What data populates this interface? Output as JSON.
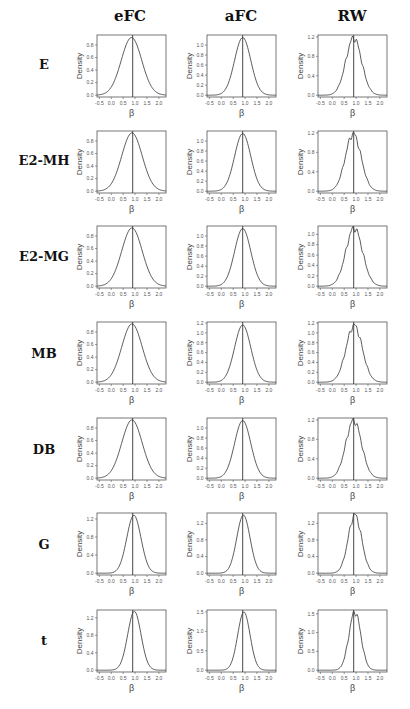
{
  "chart_data": {
    "type": "line",
    "layout": "grid 7 rows x 3 columns of density plots",
    "columns": [
      "eFC",
      "aFC",
      "RW"
    ],
    "rows": [
      "E",
      "E2-MH",
      "E2-MG",
      "MB",
      "DB",
      "G",
      "t"
    ],
    "xlabel": "β",
    "ylabel": "Density",
    "xlim": [
      -0.6,
      2.3
    ],
    "xticks": [
      -0.5,
      0.0,
      0.5,
      1.0,
      1.5,
      2.0
    ],
    "xtick_labels": [
      "-0.5",
      "0.0",
      "0.5",
      "1.0",
      "1.5",
      "2.0"
    ],
    "vertical_line_x": 0.9,
    "panels": [
      {
        "row": "E",
        "col": "eFC",
        "mean": 0.85,
        "sd": 0.43,
        "peak": 0.92,
        "ymax": 0.96,
        "yticks": [
          0.0,
          0.2,
          0.4,
          0.6,
          0.8
        ],
        "rough": false
      },
      {
        "row": "E",
        "col": "aFC",
        "mean": 0.9,
        "sd": 0.34,
        "peak": 1.15,
        "ymax": 1.2,
        "yticks": [
          0.0,
          0.2,
          0.4,
          0.6,
          0.8,
          1.0
        ],
        "rough": false
      },
      {
        "row": "E",
        "col": "RW",
        "mean": 0.9,
        "sd": 0.33,
        "peak": 1.18,
        "ymax": 1.24,
        "yticks": [
          0.0,
          0.4,
          0.8,
          1.2
        ],
        "rough": true
      },
      {
        "row": "E2-MH",
        "col": "eFC",
        "mean": 0.87,
        "sd": 0.43,
        "peak": 0.93,
        "ymax": 0.96,
        "yticks": [
          0.0,
          0.2,
          0.4,
          0.6,
          0.8
        ],
        "rough": false
      },
      {
        "row": "E2-MH",
        "col": "aFC",
        "mean": 0.9,
        "sd": 0.34,
        "peak": 1.15,
        "ymax": 1.2,
        "yticks": [
          0.0,
          0.2,
          0.4,
          0.6,
          0.8,
          1.0
        ],
        "rough": false
      },
      {
        "row": "E2-MH",
        "col": "RW",
        "mean": 0.88,
        "sd": 0.33,
        "peak": 1.18,
        "ymax": 1.24,
        "yticks": [
          0.0,
          0.4,
          0.8,
          1.2
        ],
        "rough": true
      },
      {
        "row": "E2-MG",
        "col": "eFC",
        "mean": 0.87,
        "sd": 0.43,
        "peak": 0.93,
        "ymax": 0.96,
        "yticks": [
          0.0,
          0.2,
          0.4,
          0.6,
          0.8
        ],
        "rough": false
      },
      {
        "row": "E2-MG",
        "col": "aFC",
        "mean": 0.9,
        "sd": 0.34,
        "peak": 1.15,
        "ymax": 1.2,
        "yticks": [
          0.0,
          0.2,
          0.4,
          0.6,
          0.8,
          1.0
        ],
        "rough": false
      },
      {
        "row": "E2-MG",
        "col": "RW",
        "mean": 0.92,
        "sd": 0.35,
        "peak": 1.12,
        "ymax": 1.16,
        "yticks": [
          0.0,
          0.2,
          0.4,
          0.6,
          0.8,
          1.0
        ],
        "rough": true
      },
      {
        "row": "MB",
        "col": "eFC",
        "mean": 0.87,
        "sd": 0.43,
        "peak": 0.93,
        "ymax": 0.96,
        "yticks": [
          0.0,
          0.2,
          0.4,
          0.6,
          0.8
        ],
        "rough": false
      },
      {
        "row": "MB",
        "col": "aFC",
        "mean": 0.9,
        "sd": 0.34,
        "peak": 1.16,
        "ymax": 1.22,
        "yticks": [
          0.0,
          0.2,
          0.4,
          0.6,
          0.8,
          1.0,
          1.2
        ],
        "rough": false
      },
      {
        "row": "MB",
        "col": "RW",
        "mean": 0.92,
        "sd": 0.34,
        "peak": 1.15,
        "ymax": 1.22,
        "yticks": [
          0.0,
          0.2,
          0.4,
          0.6,
          0.8,
          1.0,
          1.2
        ],
        "rough": true
      },
      {
        "row": "DB",
        "col": "eFC",
        "mean": 0.87,
        "sd": 0.43,
        "peak": 0.93,
        "ymax": 0.96,
        "yticks": [
          0.0,
          0.2,
          0.4,
          0.6,
          0.8
        ],
        "rough": false
      },
      {
        "row": "DB",
        "col": "aFC",
        "mean": 0.9,
        "sd": 0.34,
        "peak": 1.15,
        "ymax": 1.2,
        "yticks": [
          0.0,
          0.2,
          0.4,
          0.6,
          0.8,
          1.0
        ],
        "rough": false
      },
      {
        "row": "DB",
        "col": "RW",
        "mean": 0.9,
        "sd": 0.33,
        "peak": 1.19,
        "ymax": 1.24,
        "yticks": [
          0.0,
          0.4,
          0.8,
          1.2
        ],
        "rough": true
      },
      {
        "row": "G",
        "col": "eFC",
        "mean": 0.95,
        "sd": 0.3,
        "peak": 1.28,
        "ymax": 1.33,
        "yticks": [
          0.0,
          0.4,
          0.8,
          1.2
        ],
        "rough": false
      },
      {
        "row": "G",
        "col": "aFC",
        "mean": 0.93,
        "sd": 0.28,
        "peak": 1.4,
        "ymax": 1.45,
        "yticks": [
          0.0,
          0.4,
          0.8,
          1.2
        ],
        "rough": false
      },
      {
        "row": "G",
        "col": "RW",
        "mean": 0.95,
        "sd": 0.28,
        "peak": 1.4,
        "ymax": 1.45,
        "yticks": [
          0.0,
          0.4,
          0.8,
          1.2
        ],
        "rough": true
      },
      {
        "row": "t",
        "col": "eFC",
        "mean": 0.97,
        "sd": 0.28,
        "peak": 1.35,
        "ymax": 1.38,
        "yticks": [
          0.0,
          0.4,
          0.8,
          1.2
        ],
        "rough": false
      },
      {
        "row": "t",
        "col": "aFC",
        "mean": 0.95,
        "sd": 0.26,
        "peak": 1.5,
        "ymax": 1.55,
        "yticks": [
          0.0,
          0.5,
          1.0,
          1.5
        ],
        "rough": false
      },
      {
        "row": "t",
        "col": "RW",
        "mean": 0.95,
        "sd": 0.25,
        "peak": 1.55,
        "ymax": 1.6,
        "yticks": [
          0.0,
          0.5,
          1.0,
          1.5
        ],
        "rough": true
      }
    ]
  },
  "header": {
    "columns": [
      "eFC",
      "aFC",
      "RW"
    ]
  },
  "rows": [
    "E",
    "E2-MH",
    "E2-MG",
    "MB",
    "DB",
    "G",
    "t"
  ]
}
